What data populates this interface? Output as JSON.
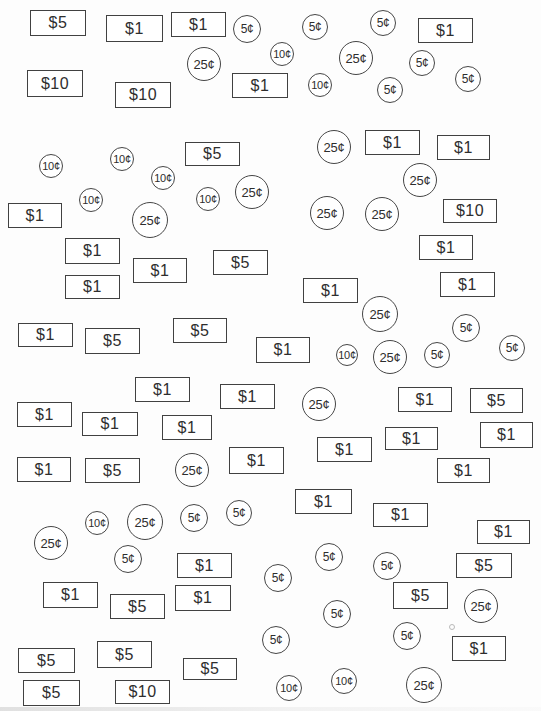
{
  "canvas": {
    "width": 541,
    "height": 711,
    "background": "#fdfdfd",
    "ink": "#414141",
    "text_color": "#2e2e2e"
  },
  "denominations": {
    "bills": [
      "$1",
      "$5",
      "$10"
    ],
    "coins": [
      "5¢",
      "10¢",
      "25¢"
    ]
  },
  "items": [
    {
      "kind": "bill",
      "label": "$5",
      "x": 30,
      "y": 10,
      "w": 56,
      "h": 26
    },
    {
      "kind": "bill",
      "label": "$1",
      "x": 106,
      "y": 15,
      "w": 57,
      "h": 27
    },
    {
      "kind": "bill",
      "label": "$1",
      "x": 171,
      "y": 12,
      "w": 55,
      "h": 25
    },
    {
      "kind": "coin",
      "label": "5¢",
      "cx": 247,
      "cy": 29,
      "r": 14
    },
    {
      "kind": "coin",
      "label": "5¢",
      "cx": 315,
      "cy": 27,
      "r": 13
    },
    {
      "kind": "coin",
      "label": "5¢",
      "cx": 383,
      "cy": 23,
      "r": 13
    },
    {
      "kind": "bill",
      "label": "$1",
      "x": 418,
      "y": 18,
      "w": 55,
      "h": 25
    },
    {
      "kind": "coin",
      "label": "25¢",
      "cx": 204,
      "cy": 64,
      "r": 17
    },
    {
      "kind": "coin",
      "label": "10¢",
      "cx": 282,
      "cy": 54,
      "r": 12
    },
    {
      "kind": "coin",
      "label": "25¢",
      "cx": 356,
      "cy": 58,
      "r": 17
    },
    {
      "kind": "coin",
      "label": "5¢",
      "cx": 422,
      "cy": 63,
      "r": 13
    },
    {
      "kind": "coin",
      "label": "5¢",
      "cx": 468,
      "cy": 79,
      "r": 13
    },
    {
      "kind": "bill",
      "label": "$10",
      "x": 27,
      "y": 70,
      "w": 56,
      "h": 27
    },
    {
      "kind": "bill",
      "label": "$10",
      "x": 115,
      "y": 82,
      "w": 56,
      "h": 26
    },
    {
      "kind": "bill",
      "label": "$1",
      "x": 232,
      "y": 73,
      "w": 56,
      "h": 25
    },
    {
      "kind": "coin",
      "label": "10¢",
      "cx": 320,
      "cy": 85,
      "r": 12
    },
    {
      "kind": "coin",
      "label": "5¢",
      "cx": 390,
      "cy": 90,
      "r": 13
    },
    {
      "kind": "coin",
      "label": "25¢",
      "cx": 334,
      "cy": 147,
      "r": 17
    },
    {
      "kind": "bill",
      "label": "$1",
      "x": 365,
      "y": 130,
      "w": 55,
      "h": 25
    },
    {
      "kind": "bill",
      "label": "$1",
      "x": 437,
      "y": 135,
      "w": 53,
      "h": 25
    },
    {
      "kind": "coin",
      "label": "10¢",
      "cx": 51,
      "cy": 166,
      "r": 12
    },
    {
      "kind": "coin",
      "label": "10¢",
      "cx": 122,
      "cy": 159,
      "r": 12
    },
    {
      "kind": "bill",
      "label": "$5",
      "x": 185,
      "y": 142,
      "w": 55,
      "h": 24
    },
    {
      "kind": "coin",
      "label": "10¢",
      "cx": 163,
      "cy": 178,
      "r": 12
    },
    {
      "kind": "coin",
      "label": "25¢",
      "cx": 420,
      "cy": 180,
      "r": 17
    },
    {
      "kind": "coin",
      "label": "10¢",
      "cx": 91,
      "cy": 200,
      "r": 12
    },
    {
      "kind": "coin",
      "label": "10¢",
      "cx": 208,
      "cy": 199,
      "r": 12
    },
    {
      "kind": "coin",
      "label": "25¢",
      "cx": 252,
      "cy": 192,
      "r": 17
    },
    {
      "kind": "bill",
      "label": "$1",
      "x": 8,
      "y": 203,
      "w": 54,
      "h": 25
    },
    {
      "kind": "coin",
      "label": "25¢",
      "cx": 150,
      "cy": 220,
      "r": 18
    },
    {
      "kind": "coin",
      "label": "25¢",
      "cx": 327,
      "cy": 213,
      "r": 17
    },
    {
      "kind": "coin",
      "label": "25¢",
      "cx": 382,
      "cy": 214,
      "r": 17
    },
    {
      "kind": "bill",
      "label": "$10",
      "x": 443,
      "y": 199,
      "w": 54,
      "h": 24
    },
    {
      "kind": "bill",
      "label": "$1",
      "x": 419,
      "y": 235,
      "w": 54,
      "h": 25
    },
    {
      "kind": "bill",
      "label": "$1",
      "x": 65,
      "y": 238,
      "w": 55,
      "h": 26
    },
    {
      "kind": "bill",
      "label": "$1",
      "x": 133,
      "y": 258,
      "w": 54,
      "h": 25
    },
    {
      "kind": "bill",
      "label": "$5",
      "x": 213,
      "y": 250,
      "w": 55,
      "h": 25
    },
    {
      "kind": "bill",
      "label": "$1",
      "x": 65,
      "y": 275,
      "w": 55,
      "h": 24
    },
    {
      "kind": "bill",
      "label": "$1",
      "x": 303,
      "y": 278,
      "w": 55,
      "h": 25
    },
    {
      "kind": "bill",
      "label": "$1",
      "x": 440,
      "y": 272,
      "w": 55,
      "h": 25
    },
    {
      "kind": "bill",
      "label": "$1",
      "x": 18,
      "y": 323,
      "w": 55,
      "h": 24
    },
    {
      "kind": "bill",
      "label": "$5",
      "x": 85,
      "y": 328,
      "w": 55,
      "h": 26
    },
    {
      "kind": "bill",
      "label": "$5",
      "x": 173,
      "y": 318,
      "w": 54,
      "h": 25
    },
    {
      "kind": "coin",
      "label": "25¢",
      "cx": 380,
      "cy": 314,
      "r": 18
    },
    {
      "kind": "coin",
      "label": "5¢",
      "cx": 466,
      "cy": 328,
      "r": 14
    },
    {
      "kind": "bill",
      "label": "$1",
      "x": 256,
      "y": 337,
      "w": 54,
      "h": 26
    },
    {
      "kind": "coin",
      "label": "10¢",
      "cx": 347,
      "cy": 355,
      "r": 11
    },
    {
      "kind": "coin",
      "label": "25¢",
      "cx": 390,
      "cy": 357,
      "r": 17
    },
    {
      "kind": "coin",
      "label": "5¢",
      "cx": 437,
      "cy": 355,
      "r": 13
    },
    {
      "kind": "coin",
      "label": "5¢",
      "cx": 512,
      "cy": 348,
      "r": 13
    },
    {
      "kind": "bill",
      "label": "$1",
      "x": 135,
      "y": 377,
      "w": 55,
      "h": 25
    },
    {
      "kind": "bill",
      "label": "$1",
      "x": 220,
      "y": 384,
      "w": 55,
      "h": 25
    },
    {
      "kind": "bill",
      "label": "$1",
      "x": 398,
      "y": 387,
      "w": 54,
      "h": 25
    },
    {
      "kind": "bill",
      "label": "$5",
      "x": 470,
      "y": 388,
      "w": 53,
      "h": 25
    },
    {
      "kind": "bill",
      "label": "$1",
      "x": 17,
      "y": 402,
      "w": 55,
      "h": 25
    },
    {
      "kind": "bill",
      "label": "$1",
      "x": 82,
      "y": 412,
      "w": 56,
      "h": 24
    },
    {
      "kind": "bill",
      "label": "$1",
      "x": 162,
      "y": 415,
      "w": 50,
      "h": 25
    },
    {
      "kind": "coin",
      "label": "25¢",
      "cx": 319,
      "cy": 404,
      "r": 17
    },
    {
      "kind": "bill",
      "label": "$1",
      "x": 385,
      "y": 427,
      "w": 53,
      "h": 23
    },
    {
      "kind": "bill",
      "label": "$1",
      "x": 480,
      "y": 422,
      "w": 53,
      "h": 26
    },
    {
      "kind": "bill",
      "label": "$1",
      "x": 317,
      "y": 437,
      "w": 55,
      "h": 25
    },
    {
      "kind": "bill",
      "label": "$1",
      "x": 229,
      "y": 447,
      "w": 55,
      "h": 27
    },
    {
      "kind": "bill",
      "label": "$1",
      "x": 17,
      "y": 457,
      "w": 54,
      "h": 25
    },
    {
      "kind": "bill",
      "label": "$5",
      "x": 85,
      "y": 458,
      "w": 55,
      "h": 25
    },
    {
      "kind": "coin",
      "label": "25¢",
      "cx": 192,
      "cy": 470,
      "r": 17
    },
    {
      "kind": "bill",
      "label": "$1",
      "x": 437,
      "y": 458,
      "w": 53,
      "h": 25
    },
    {
      "kind": "bill",
      "label": "$1",
      "x": 295,
      "y": 489,
      "w": 57,
      "h": 25
    },
    {
      "kind": "bill",
      "label": "$1",
      "x": 373,
      "y": 503,
      "w": 55,
      "h": 24
    },
    {
      "kind": "coin",
      "label": "10¢",
      "cx": 97,
      "cy": 523,
      "r": 12
    },
    {
      "kind": "coin",
      "label": "25¢",
      "cx": 145,
      "cy": 522,
      "r": 18
    },
    {
      "kind": "coin",
      "label": "5¢",
      "cx": 194,
      "cy": 518,
      "r": 14
    },
    {
      "kind": "coin",
      "label": "5¢",
      "cx": 239,
      "cy": 513,
      "r": 13
    },
    {
      "kind": "bill",
      "label": "$1",
      "x": 477,
      "y": 520,
      "w": 53,
      "h": 24
    },
    {
      "kind": "coin",
      "label": "25¢",
      "cx": 51,
      "cy": 543,
      "r": 17
    },
    {
      "kind": "coin",
      "label": "5¢",
      "cx": 128,
      "cy": 559,
      "r": 14
    },
    {
      "kind": "bill",
      "label": "$1",
      "x": 177,
      "y": 553,
      "w": 55,
      "h": 25
    },
    {
      "kind": "coin",
      "label": "5¢",
      "cx": 329,
      "cy": 557,
      "r": 14
    },
    {
      "kind": "coin",
      "label": "5¢",
      "cx": 387,
      "cy": 566,
      "r": 14
    },
    {
      "kind": "bill",
      "label": "$5",
      "x": 456,
      "y": 553,
      "w": 56,
      "h": 25
    },
    {
      "kind": "coin",
      "label": "5¢",
      "cx": 278,
      "cy": 578,
      "r": 14
    },
    {
      "kind": "bill",
      "label": "$1",
      "x": 43,
      "y": 582,
      "w": 55,
      "h": 26
    },
    {
      "kind": "bill",
      "label": "$1",
      "x": 175,
      "y": 585,
      "w": 56,
      "h": 26
    },
    {
      "kind": "bill",
      "label": "$5",
      "x": 110,
      "y": 594,
      "w": 55,
      "h": 25
    },
    {
      "kind": "bill",
      "label": "$5",
      "x": 393,
      "y": 582,
      "w": 55,
      "h": 27
    },
    {
      "kind": "speck",
      "label": "",
      "cx": 452,
      "cy": 627,
      "r": 3
    },
    {
      "kind": "coin",
      "label": "25¢",
      "cx": 481,
      "cy": 606,
      "r": 17
    },
    {
      "kind": "coin",
      "label": "5¢",
      "cx": 337,
      "cy": 614,
      "r": 14
    },
    {
      "kind": "coin",
      "label": "5¢",
      "cx": 276,
      "cy": 640,
      "r": 14
    },
    {
      "kind": "coin",
      "label": "5¢",
      "cx": 407,
      "cy": 636,
      "r": 14
    },
    {
      "kind": "bill",
      "label": "$1",
      "x": 452,
      "y": 636,
      "w": 54,
      "h": 25
    },
    {
      "kind": "bill",
      "label": "$5",
      "x": 18,
      "y": 648,
      "w": 57,
      "h": 25
    },
    {
      "kind": "bill",
      "label": "$5",
      "x": 97,
      "y": 641,
      "w": 55,
      "h": 27
    },
    {
      "kind": "bill",
      "label": "$5",
      "x": 183,
      "y": 658,
      "w": 54,
      "h": 22
    },
    {
      "kind": "bill",
      "label": "$5",
      "x": 23,
      "y": 680,
      "w": 57,
      "h": 26
    },
    {
      "kind": "bill",
      "label": "$10",
      "x": 115,
      "y": 680,
      "w": 55,
      "h": 24
    },
    {
      "kind": "coin",
      "label": "10¢",
      "cx": 289,
      "cy": 688,
      "r": 13
    },
    {
      "kind": "coin",
      "label": "10¢",
      "cx": 344,
      "cy": 681,
      "r": 13
    },
    {
      "kind": "coin",
      "label": "25¢",
      "cx": 424,
      "cy": 685,
      "r": 18
    }
  ]
}
